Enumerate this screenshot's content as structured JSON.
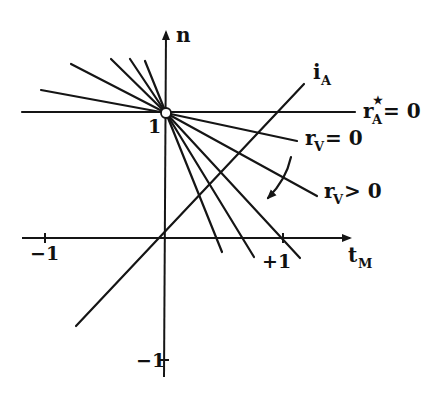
{
  "diagram": {
    "type": "line-diagram",
    "axes": {
      "x_label": "t",
      "x_label_sub": "M",
      "y_label": "n",
      "x_ticks": [
        {
          "value": -1,
          "label": "−1"
        },
        {
          "value": 1,
          "label": "+1"
        }
      ],
      "y_ticks": [
        {
          "value": 1,
          "label": "1"
        },
        {
          "value": -1,
          "label": "−1"
        }
      ]
    },
    "labels": {
      "iA_main": "i",
      "iA_sub": "A",
      "rA_main": "r",
      "rA_sub": "A",
      "rA_sup": "★",
      "rA_eq": "= 0",
      "rV0_main": "r",
      "rV0_sub": "V",
      "rV0_eq": "= 0",
      "rVpos_main": "r",
      "rVpos_sub": "V",
      "rVpos_eq": "> 0"
    },
    "annotations": {
      "pivot_point": "open circle at (t_M=0, n=1)",
      "rotation_arrow": "curved arrow indicating rotation with increasing r_V"
    }
  }
}
